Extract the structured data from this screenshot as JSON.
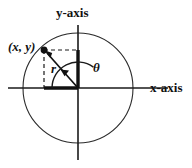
{
  "figure": {
    "type": "polar-coordinate-diagram",
    "background_color": "#ffffff",
    "stroke_color": "#1a1a1a",
    "labels": {
      "y_axis": "y-axis",
      "x_axis": "x-axis",
      "point": "(x, y)",
      "radius": "r",
      "angle": "θ"
    },
    "geometry": {
      "origin": {
        "x": 78,
        "y": 88
      },
      "circle_radius": 55,
      "point": {
        "x": 44,
        "y": 50
      },
      "x_axis_span": {
        "from": 8,
        "to": 168
      },
      "y_axis_span": {
        "from": 25,
        "to": 160
      },
      "angle_arc_radius": 26,
      "angle_degrees": 132
    },
    "elements": {
      "circle": "unit-circle",
      "radius_line": "r-segment-from-origin-to-point",
      "vertical_dashed": "dashed-line-from-point-down-to-x-axis",
      "horizontal_dashed": "dashed-line-from-point-right-to-y-axis",
      "y_projection": "thick-segment-on-y-axis",
      "x_projection": "thick-segment-on-x-axis",
      "angle_arc": "theta-arc-with-arrowhead",
      "point_marker": "filled-dot-at-point"
    }
  }
}
